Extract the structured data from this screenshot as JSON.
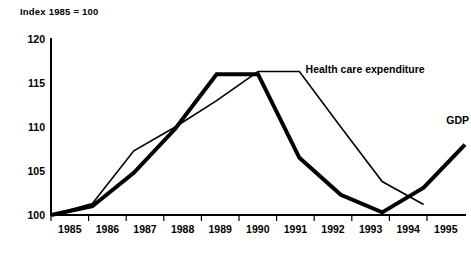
{
  "chart": {
    "title": "Index 1985 = 100",
    "gdp_annotation": "GDP",
    "health_annotation": "Health care expenditure"
  },
  "chart_data": {
    "type": "line",
    "title": "Index 1985 = 100",
    "xlabel": "",
    "ylabel": "",
    "x": [
      1985,
      1986,
      1987,
      1988,
      1989,
      1990,
      1991,
      1992,
      1993,
      1994,
      1995
    ],
    "xtick_labels": [
      "1985",
      "1986",
      "1987",
      "1988",
      "1989",
      "1990",
      "1991",
      "1992",
      "1993",
      "1994",
      "1995"
    ],
    "ytick_labels": [
      "100",
      "105",
      "110",
      "115",
      "120"
    ],
    "yticks": [
      100,
      105,
      110,
      115,
      120
    ],
    "ylim": [
      100,
      120
    ],
    "xlim": [
      1985,
      1995
    ],
    "grid": false,
    "legend_position": "inline-annotation",
    "series": [
      {
        "name": "GDP",
        "style": "thick-solid",
        "color": "#000000",
        "linewidth": 4,
        "x": [
          1985,
          1986,
          1987,
          1988,
          1989,
          1990,
          1991,
          1992,
          1993,
          1994,
          1995
        ],
        "values": [
          100,
          101,
          104.8,
          109.8,
          116,
          116,
          106.5,
          102.3,
          100.3,
          103.1,
          108
        ]
      },
      {
        "name": "Health care expenditure",
        "style": "thin-solid",
        "color": "#000000",
        "linewidth": 1.6,
        "x": [
          1985,
          1986,
          1987,
          1988,
          1989,
          1990,
          1991,
          1992,
          1993,
          1994
        ],
        "values": [
          100,
          101.3,
          107.3,
          110,
          113,
          116.3,
          116.3,
          110,
          103.8,
          101.2
        ]
      }
    ],
    "annotations": [
      {
        "text": "Health care expenditure",
        "x": 1991.15,
        "y": 116.1
      },
      {
        "text": "GDP",
        "x": 1994.55,
        "y": 110.3
      }
    ]
  }
}
